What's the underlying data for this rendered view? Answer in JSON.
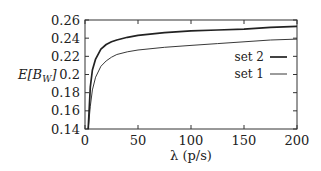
{
  "chart_data": {
    "type": "line",
    "title": "",
    "xlabel": "λ (p/s)",
    "ylabel": "E[B_W]",
    "xlim": [
      0,
      200
    ],
    "ylim": [
      0.14,
      0.26
    ],
    "xticks": [
      0,
      50,
      100,
      150,
      200
    ],
    "yticks": [
      0.14,
      0.16,
      0.18,
      0.2,
      0.22,
      0.24,
      0.26
    ],
    "xtick_labels": [
      "0",
      "50",
      "100",
      "150",
      "200"
    ],
    "ytick_labels": [
      "0.14",
      "0.16",
      "0.18",
      "0.2",
      "0.22",
      "0.24",
      "0.26"
    ],
    "grid": false,
    "legend_position": "right, inside",
    "x": [
      3,
      5,
      7,
      10,
      15,
      20,
      25,
      30,
      40,
      50,
      75,
      100,
      125,
      150,
      175,
      200
    ],
    "series": [
      {
        "name": "set 2",
        "line_weight": "thick",
        "values": [
          0.14,
          0.186,
          0.205,
          0.217,
          0.228,
          0.233,
          0.236,
          0.238,
          0.241,
          0.243,
          0.246,
          0.248,
          0.249,
          0.25,
          0.252,
          0.253
        ]
      },
      {
        "name": "set 1",
        "line_weight": "thin",
        "values": [
          0.14,
          0.165,
          0.183,
          0.197,
          0.209,
          0.215,
          0.219,
          0.222,
          0.225,
          0.227,
          0.23,
          0.232,
          0.234,
          0.236,
          0.238,
          0.239
        ]
      }
    ]
  },
  "legend": {
    "items": [
      {
        "label": "set 2"
      },
      {
        "label": "set 1"
      }
    ]
  },
  "axes": {
    "xlabel": "λ (p/s)",
    "ylabel_main": "E[B",
    "ylabel_sub": "W",
    "ylabel_close": "]"
  }
}
